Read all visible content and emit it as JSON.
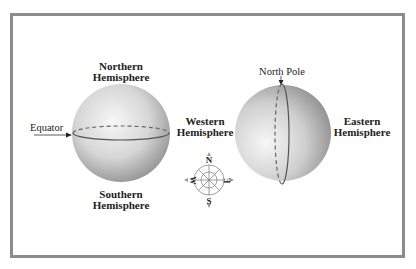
{
  "diagram": {
    "left_globe": {
      "top_label_line1": "Northern",
      "top_label_line2": "Hemisphere",
      "bottom_label_line1": "Southern",
      "bottom_label_line2": "Hemisphere",
      "line_label": "Equator"
    },
    "right_globe": {
      "pole_label": "North Pole",
      "left_label_line1": "Western",
      "left_label_line2": "Hemisphere",
      "right_label_line1": "Eastern",
      "right_label_line2": "Hemisphere"
    },
    "compass": {
      "north": "N",
      "south": "S",
      "east": "E",
      "west": "W"
    },
    "colors": {
      "frame": "#8c8c8c",
      "globe_light": "#f5f5f5",
      "globe_dark": "#8a8a8a",
      "line": "#555555"
    }
  }
}
